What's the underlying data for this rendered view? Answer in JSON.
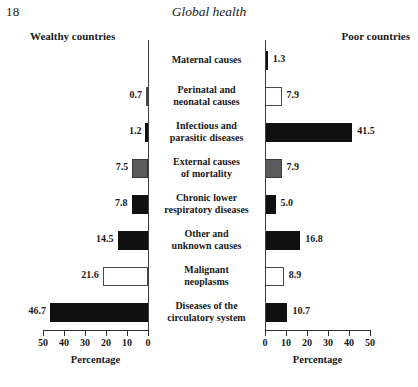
{
  "page": {
    "number": "18",
    "running_head": "Global health"
  },
  "headers": {
    "left": "Wealthy countries",
    "right": "Poor countries"
  },
  "axes": {
    "left": {
      "title": "Percentage",
      "ticks": [
        "50",
        "40",
        "30",
        "20",
        "10",
        "0"
      ],
      "max": 50,
      "direction": "reversed"
    },
    "right": {
      "title": "Percentage",
      "ticks": [
        "0",
        "10",
        "20",
        "30",
        "40",
        "50"
      ],
      "max": 50,
      "direction": "normal"
    }
  },
  "chart_data": {
    "type": "bar",
    "orientation": "horizontal",
    "layout": "paired-diverging-pyramid",
    "title": "Global health",
    "xlabel": "Percentage",
    "ylabel": "",
    "xlim": [
      0,
      50
    ],
    "grid": false,
    "legend": "none",
    "categories": [
      "Maternal causes",
      "Perinatal and neonatal causes",
      "Infectious and parasitic diseases",
      "External causes of mortality",
      "Chronic lower respiratory diseases",
      "Other and unknown causes",
      "Malignant neoplasms",
      "Diseases of the circulatory system"
    ],
    "category_lines": [
      [
        "Maternal causes"
      ],
      [
        "Perinatal and",
        "neonatal causes"
      ],
      [
        "Infectious and",
        "parasitic diseases"
      ],
      [
        "External causes",
        "of mortality"
      ],
      [
        "Chronic lower",
        "respiratory diseases"
      ],
      [
        "Other and",
        "unknown causes"
      ],
      [
        "Malignant",
        "neoplasms"
      ],
      [
        "Diseases of the",
        "circulatory system"
      ]
    ],
    "series": [
      {
        "name": "Wealthy countries",
        "values": [
          null,
          0.7,
          1.2,
          7.5,
          7.8,
          14.5,
          21.6,
          46.7
        ],
        "labels": [
          "",
          "0.7",
          "1.2",
          "7.5",
          "7.8",
          "14.5",
          "21.6",
          "46.7"
        ],
        "fills": [
          "solid",
          "open",
          "solid",
          "gray",
          "solid",
          "solid",
          "open",
          "solid"
        ]
      },
      {
        "name": "Poor countries",
        "values": [
          1.3,
          7.9,
          41.5,
          7.9,
          5.0,
          16.8,
          8.9,
          10.7
        ],
        "labels": [
          "1.3",
          "7.9",
          "41.5",
          "7.9",
          "5.0",
          "16.8",
          "8.9",
          "10.7"
        ],
        "fills": [
          "solid",
          "open",
          "solid",
          "gray",
          "solid",
          "solid",
          "open",
          "solid"
        ]
      }
    ]
  },
  "colors": {
    "solid": "#101010",
    "gray": "#5a5a5a",
    "open": "#ffffff",
    "outline": "#3d3d3d",
    "text": "#1a1a1a"
  }
}
